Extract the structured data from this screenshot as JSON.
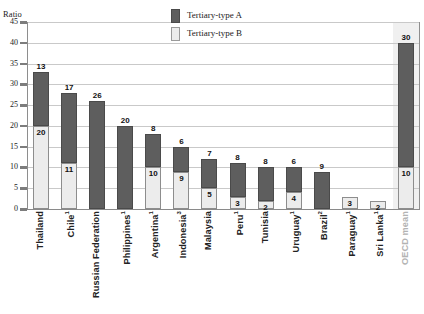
{
  "axis_title": "Ratio",
  "legend": {
    "items": [
      {
        "label": "Tertiary-type A",
        "color": "#5e5e5e",
        "name": "legend-tertiary-type-a"
      },
      {
        "label": "Tertiary-type B",
        "color": "#ececec",
        "name": "legend-tertiary-type-b"
      }
    ]
  },
  "yticks": [
    "45",
    "40",
    "35",
    "30",
    "25",
    "20",
    "15",
    "10",
    "5",
    "0"
  ],
  "chart_data": {
    "type": "bar",
    "subtype": "stacked-bar",
    "title": "",
    "xlabel": "",
    "ylabel": "Ratio",
    "ylim": [
      0,
      45
    ],
    "ytick_step": 5,
    "grid": true,
    "legend_position": "top-center",
    "categories": [
      "Thailand",
      "Chile¹",
      "Russian Federation",
      "Philippines¹",
      "Argentina¹",
      "Indonesia³",
      "Malaysia",
      "Peru¹",
      "Tunisia",
      "Uruguay¹",
      "Brazil²",
      "Paraguay¹",
      "Sri Lanka¹",
      "OECD mean"
    ],
    "category_labels": [
      {
        "text": "Thailand",
        "sup": "",
        "muted": false
      },
      {
        "text": "Chile",
        "sup": "1",
        "muted": false
      },
      {
        "text": "Russian Federation",
        "sup": "",
        "muted": false
      },
      {
        "text": "Philippines",
        "sup": "1",
        "muted": false
      },
      {
        "text": "Argentina",
        "sup": "1",
        "muted": false
      },
      {
        "text": "Indonesia",
        "sup": "3",
        "muted": false
      },
      {
        "text": "Malaysia",
        "sup": "",
        "muted": false
      },
      {
        "text": "Peru",
        "sup": "1",
        "muted": false
      },
      {
        "text": "Tunisia",
        "sup": "",
        "muted": false
      },
      {
        "text": "Uruguay",
        "sup": "1",
        "muted": false
      },
      {
        "text": "Brazil",
        "sup": "2",
        "muted": false
      },
      {
        "text": "Paraguay",
        "sup": "1",
        "muted": false
      },
      {
        "text": "Sri Lanka",
        "sup": "1",
        "muted": false
      },
      {
        "text": "OECD mean",
        "sup": "",
        "muted": true
      }
    ],
    "series": [
      {
        "name": "Tertiary-type B",
        "color": "#ececec",
        "values": [
          20,
          11,
          0,
          0,
          10,
          9,
          5,
          3,
          2,
          4,
          0,
          3,
          2,
          10
        ]
      },
      {
        "name": "Tertiary-type A",
        "color": "#5e5e5e",
        "values": [
          13,
          17,
          26,
          20,
          8,
          6,
          7,
          8,
          8,
          6,
          9,
          0,
          0,
          30
        ]
      }
    ],
    "totals": [
      33,
      28,
      26,
      20,
      18,
      15,
      12,
      11,
      10,
      10,
      9,
      3,
      2,
      40
    ],
    "highlight_category": "OECD mean"
  }
}
